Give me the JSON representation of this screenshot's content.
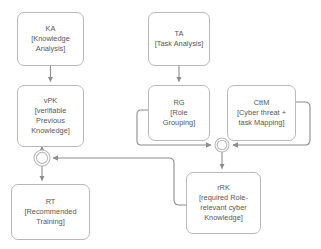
{
  "diagram": {
    "type": "flowchart",
    "nodes": [
      {
        "id": "KA",
        "code": "KA",
        "desc_line1": "[Knowledge",
        "desc_line2": "Analysis]",
        "x": 17,
        "y": 12,
        "w": 67,
        "h": 54
      },
      {
        "id": "vPK",
        "code": "vPK",
        "desc_line1": "[verifiable",
        "desc_line2": "Previous",
        "desc_line3": "Knowledge]",
        "x": 17,
        "y": 85,
        "w": 67,
        "h": 62
      },
      {
        "id": "RT",
        "code": "RT",
        "desc_line1": "[Recommended",
        "desc_line2": "Training]",
        "x": 11,
        "y": 184,
        "w": 79,
        "h": 56
      },
      {
        "id": "TA",
        "code": "TA",
        "desc_line1": "[Task Analysis]",
        "x": 148,
        "y": 12,
        "w": 62,
        "h": 54
      },
      {
        "id": "RG",
        "code": "RG",
        "desc_line1": "[Role",
        "desc_line2": "Grouping]",
        "x": 148,
        "y": 85,
        "w": 62,
        "h": 56
      },
      {
        "id": "CttM",
        "code": "CttM",
        "desc_line1": "[Cyber threat +",
        "desc_line2": "task Mapping]",
        "x": 227,
        "y": 85,
        "w": 69,
        "h": 56
      },
      {
        "id": "rRK",
        "code": "rRK",
        "desc_line1": "[required Role-",
        "desc_line2": "relevant cyber",
        "desc_line3": "Knowledge]",
        "x": 186,
        "y": 172,
        "w": 75,
        "h": 62
      }
    ],
    "junctions": [
      {
        "id": "merge-left",
        "cx": 42,
        "cy": 158,
        "r_outer": 8,
        "r_inner": 6
      },
      {
        "id": "merge-right",
        "cx": 222,
        "cy": 145,
        "r_outer": 7,
        "r_inner": 5.2
      }
    ],
    "edges": [
      {
        "id": "ka-to-vpk",
        "from": "KA",
        "to": "vPK"
      },
      {
        "id": "vpk-to-merge-left",
        "from": "vPK",
        "to": "merge-left"
      },
      {
        "id": "merge-left-to-rt",
        "from": "merge-left",
        "to": "RT"
      },
      {
        "id": "ta-to-rg",
        "from": "TA",
        "to": "RG"
      },
      {
        "id": "rg-to-merge-right",
        "from": "RG",
        "to": "merge-right"
      },
      {
        "id": "cttm-to-merge-right",
        "from": "CttM",
        "to": "merge-right"
      },
      {
        "id": "merge-right-to-rrk",
        "from": "merge-right",
        "to": "rRK"
      },
      {
        "id": "rrk-to-merge-left",
        "from": "rRK",
        "to": "merge-left"
      }
    ],
    "colors": {
      "stroke": "#b9b9b9",
      "connector": "#8c8c8c",
      "text": "#575757",
      "background": "#ffffff"
    }
  }
}
